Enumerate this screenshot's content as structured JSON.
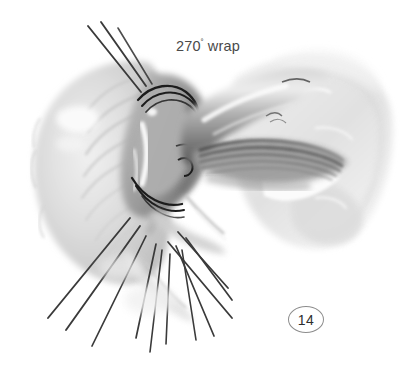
{
  "figure": {
    "kind": "medical-surgical-illustration",
    "rendering": "grayscale airbrush / wash drawing on white background",
    "width_px": 413,
    "height_px": 368,
    "background_color": "#ffffff"
  },
  "annotations": {
    "wrap_label": {
      "value": "270",
      "degree_symbol": "˚",
      "suffix": "wrap",
      "full_text": "270˚ wrap",
      "color": "#4a4a4a",
      "position": {
        "x": 176,
        "y": 38
      }
    },
    "figure_number": {
      "text": "14",
      "shape": "oval-outline",
      "outline_color": "#8d8d8d",
      "text_color": "#2e2e2e",
      "position": {
        "x": 288,
        "y": 306
      }
    }
  },
  "palette": {
    "paper_white": "#ffffff",
    "tissue_lightest": "#f2f2f2",
    "tissue_light": "#dcdcdc",
    "tissue_mid": "#b4b4b4",
    "tissue_mid_dark": "#8a8a8a",
    "tissue_shadow": "#5f5f5f",
    "tissue_deep_shadow": "#3c3c3c",
    "highlight_white": "#fbfbfb",
    "suture_thread": "#3a3a3a",
    "suture_line_dark": "#1e1e1e"
  },
  "anatomy": {
    "parts": [
      {
        "name": "gastric-fundus",
        "description": "fan-shaped pale stomach fundus occupying the left third, radial surface folds",
        "tone": "#d8d8d8"
      },
      {
        "name": "wrap-fold",
        "description": "rolled cuff of fundus curving up and over, forming the 270 degree collar",
        "tone": "#bcbcbc"
      },
      {
        "name": "esophagus",
        "description": "tubular esophagus running from the collar toward the upper right",
        "tone": "#a8a8a8"
      },
      {
        "name": "vagus-fibers",
        "description": "dark striated longitudinal fiber bands along the lower esophagus",
        "tone": "#5a5a5a"
      },
      {
        "name": "crural-tissue",
        "description": "broad soft tissue mass filling the right side of the field",
        "tone": "#e4e4e4"
      }
    ],
    "suture_lines": [
      {
        "name": "collar-suture-upper",
        "description": "dark curved stitch arcs around the top of the wrap collar"
      },
      {
        "name": "collar-suture-lower",
        "description": "dark curved stitch arcs under the wrap collar"
      }
    ],
    "suture_threads": {
      "count_top": 3,
      "count_bottom": 11,
      "convergence_point": {
        "x": 155,
        "y": 215
      },
      "color": "#3a3a3a",
      "description": "long straight traction threads radiating away from the wrap"
    }
  }
}
